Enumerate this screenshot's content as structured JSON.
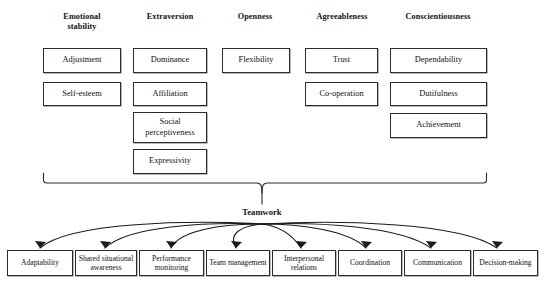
{
  "diagram": {
    "center_label": "Teamwork",
    "columns": [
      {
        "header": "Emotional\nstability",
        "header_line1": "Emotional",
        "header_line2": "stability",
        "traits": [
          "Adjustment",
          "Self-esteem"
        ]
      },
      {
        "header": "Extraversion",
        "header_line1": "Extraversion",
        "header_line2": "",
        "traits": [
          "Dominance",
          "Affiliation",
          "Social perceptiveness",
          "Expressivity"
        ]
      },
      {
        "header": "Openness",
        "header_line1": "Openness",
        "header_line2": "",
        "traits": [
          "Flexibility"
        ]
      },
      {
        "header": "Agreeableness",
        "header_line1": "Agreeableness",
        "header_line2": "",
        "traits": [
          "Trust",
          "Co-operation"
        ]
      },
      {
        "header": "Conscientiousness",
        "header_line1": "Conscientiousness",
        "header_line2": "",
        "traits": [
          "Dependability",
          "Dutifulness",
          "Achievement"
        ]
      }
    ],
    "teamwork_components": [
      "Adaptability",
      "Shared situational awareness",
      "Performance monitoring",
      "Team management",
      "Interpersonal relations",
      "Coordination",
      "Communication",
      "Decision-making"
    ],
    "colors": {
      "line": "#2b2b2b",
      "text": "#111111",
      "background": "#ffffff"
    }
  }
}
